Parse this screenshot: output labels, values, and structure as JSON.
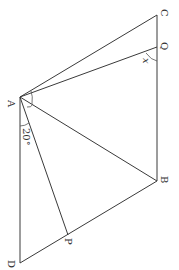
{
  "diagram": {
    "type": "geometry",
    "orientation": "rotated 90 degrees clockwise",
    "points": {
      "A": {
        "label": "A",
        "x": 20,
        "y": 97
      },
      "B": {
        "label": "B",
        "x": 157,
        "y": 181
      },
      "C": {
        "label": "C",
        "x": 157,
        "y": 15
      },
      "D": {
        "label": "D",
        "x": 20,
        "y": 263
      },
      "P": {
        "label": "P",
        "x": 68,
        "y": 235
      },
      "Q": {
        "label": "Q",
        "x": 157,
        "y": 47
      }
    },
    "segments": [
      [
        "A",
        "C"
      ],
      [
        "A",
        "Q"
      ],
      [
        "A",
        "B"
      ],
      [
        "A",
        "P"
      ],
      [
        "A",
        "D"
      ],
      [
        "C",
        "B"
      ],
      [
        "D",
        "B"
      ]
    ],
    "angle_labels": {
      "angle_DAP": "20°",
      "angle_AQB": "x"
    },
    "colors": {
      "line": "#3a3a3a",
      "text": "#333333",
      "background": "#ffffff"
    }
  }
}
